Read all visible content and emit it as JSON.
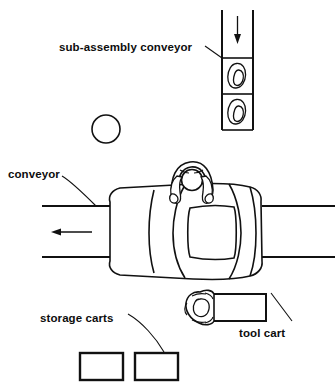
{
  "diagram": {
    "background_color": "#ffffff",
    "line_color": "#111111",
    "labels": {
      "sub_assembly_conveyor": "sub-assembly conveyor",
      "conveyor": "conveyor",
      "storage_carts": "storage  carts",
      "tool_cart": "tool cart"
    },
    "elements": {
      "sub_assembly_conveyor_track": {
        "name": "vertical sub-assembly conveyor track",
        "flow_arrow_direction": "down",
        "cells": 2,
        "part_shape": "kidney-shaped sub-assembly part"
      },
      "main_conveyor": {
        "name": "horizontal main conveyor",
        "flow_arrow_direction": "left",
        "rails": 2
      },
      "car_body": {
        "name": "car body on conveyor",
        "view": "top-down"
      },
      "assembly_worker": {
        "name": "assembly worker at car",
        "view": "top-down"
      },
      "tool_cart_worker": {
        "name": "worker with tool cart",
        "view": "top-down"
      },
      "storage_carts": {
        "name": "storage carts",
        "count": 2
      },
      "floor_marker_circle": {
        "name": "floor marker circle"
      }
    }
  }
}
